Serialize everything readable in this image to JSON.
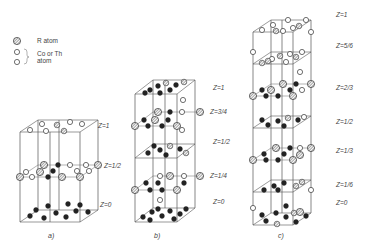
{
  "legend": {
    "r_atom": "R atom",
    "co_th_line1": "Co or Th",
    "co_th_line2": "atom"
  },
  "diagrams": [
    {
      "caption": "a)",
      "levels": [
        "Z=1",
        "Z=1/2",
        "Z=0"
      ]
    },
    {
      "caption": "b)",
      "levels": [
        "Z=1",
        "Z=3/4",
        "Z=1/2",
        "Z=1/4",
        "Z=0"
      ]
    },
    {
      "caption": "c)",
      "levels": [
        "Z=1",
        "Z=5/6",
        "Z=2/3",
        "Z=1/2",
        "Z=1/3",
        "Z=1/6",
        "Z=0"
      ]
    }
  ],
  "colors": {
    "line": "#555555",
    "atom_dark": "#222222",
    "atom_open": "#ffffff",
    "background": "#ffffff"
  }
}
